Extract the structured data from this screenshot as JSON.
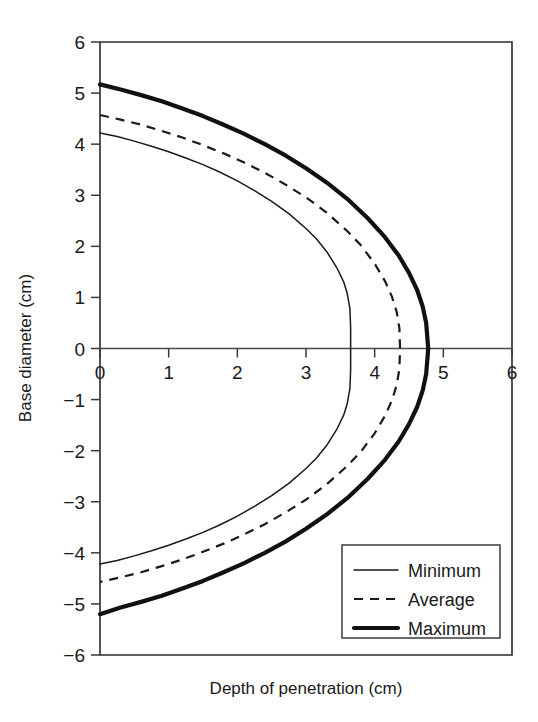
{
  "chart_data": {
    "type": "line",
    "title": "",
    "xlabel": "Depth of penetration (cm)",
    "ylabel": "Base diameter (cm)",
    "xlim": [
      0,
      6
    ],
    "ylim": [
      -6,
      6
    ],
    "xticks": [
      "0",
      "1",
      "2",
      "3",
      "4",
      "5",
      "6"
    ],
    "yticks": [
      "6",
      "5",
      "4",
      "3",
      "2",
      "1",
      "0",
      "-1",
      "-2",
      "-3",
      "-4",
      "-5",
      "-6"
    ],
    "xtick_values": [
      0,
      1,
      2,
      3,
      4,
      5,
      6
    ],
    "ytick_values": [
      6,
      5,
      4,
      3,
      2,
      1,
      0,
      -1,
      -2,
      -3,
      -4,
      -5,
      -6
    ],
    "grid": false,
    "legend_position": "lower right",
    "orientation": "x-is-depth, y-is-signed-radius (symmetric profile)",
    "series": [
      {
        "name": "Minimum",
        "style": "thin-solid",
        "color": "#1a1a1a",
        "x_at_y0": 3.65,
        "y_at_x0": 4.22,
        "points_upper": [
          [
            0.0,
            4.22
          ],
          [
            0.25,
            4.15
          ],
          [
            0.5,
            4.06
          ],
          [
            0.75,
            3.96
          ],
          [
            1.0,
            3.85
          ],
          [
            1.25,
            3.73
          ],
          [
            1.5,
            3.6
          ],
          [
            1.75,
            3.45
          ],
          [
            2.0,
            3.28
          ],
          [
            2.25,
            3.09
          ],
          [
            2.5,
            2.88
          ],
          [
            2.75,
            2.64
          ],
          [
            3.0,
            2.35
          ],
          [
            3.15,
            2.15
          ],
          [
            3.3,
            1.9
          ],
          [
            3.45,
            1.58
          ],
          [
            3.55,
            1.3
          ],
          [
            3.6,
            1.08
          ],
          [
            3.64,
            0.78
          ],
          [
            3.65,
            0.4
          ],
          [
            3.65,
            0.0
          ]
        ],
        "points_lower": [
          [
            3.65,
            0.0
          ],
          [
            3.65,
            -0.4
          ],
          [
            3.64,
            -0.78
          ],
          [
            3.6,
            -1.08
          ],
          [
            3.55,
            -1.3
          ],
          [
            3.45,
            -1.58
          ],
          [
            3.3,
            -1.9
          ],
          [
            3.15,
            -2.15
          ],
          [
            3.0,
            -2.35
          ],
          [
            2.75,
            -2.64
          ],
          [
            2.5,
            -2.88
          ],
          [
            2.25,
            -3.09
          ],
          [
            2.0,
            -3.28
          ],
          [
            1.75,
            -3.45
          ],
          [
            1.5,
            -3.6
          ],
          [
            1.25,
            -3.73
          ],
          [
            1.0,
            -3.85
          ],
          [
            0.75,
            -3.96
          ],
          [
            0.5,
            -4.06
          ],
          [
            0.25,
            -4.15
          ],
          [
            0.0,
            -4.22
          ]
        ]
      },
      {
        "name": "Average",
        "style": "dashed",
        "color": "#1a1a1a",
        "x_at_y0": 4.37,
        "y_at_x0": 4.57,
        "points_upper": [
          [
            0.0,
            4.57
          ],
          [
            0.3,
            4.48
          ],
          [
            0.6,
            4.38
          ],
          [
            0.9,
            4.26
          ],
          [
            1.2,
            4.13
          ],
          [
            1.5,
            3.98
          ],
          [
            1.8,
            3.82
          ],
          [
            2.1,
            3.64
          ],
          [
            2.4,
            3.44
          ],
          [
            2.7,
            3.21
          ],
          [
            3.0,
            2.96
          ],
          [
            3.3,
            2.66
          ],
          [
            3.6,
            2.3
          ],
          [
            3.8,
            2.02
          ],
          [
            4.0,
            1.66
          ],
          [
            4.15,
            1.32
          ],
          [
            4.25,
            1.02
          ],
          [
            4.32,
            0.72
          ],
          [
            4.36,
            0.4
          ],
          [
            4.37,
            0.0
          ]
        ],
        "points_lower": [
          [
            4.37,
            0.0
          ],
          [
            4.36,
            -0.4
          ],
          [
            4.32,
            -0.72
          ],
          [
            4.25,
            -1.02
          ],
          [
            4.15,
            -1.32
          ],
          [
            4.0,
            -1.66
          ],
          [
            3.8,
            -2.02
          ],
          [
            3.6,
            -2.3
          ],
          [
            3.3,
            -2.66
          ],
          [
            3.0,
            -2.96
          ],
          [
            2.7,
            -3.21
          ],
          [
            2.4,
            -3.44
          ],
          [
            2.1,
            -3.64
          ],
          [
            1.8,
            -3.82
          ],
          [
            1.5,
            -3.98
          ],
          [
            1.2,
            -4.13
          ],
          [
            0.9,
            -4.26
          ],
          [
            0.6,
            -4.38
          ],
          [
            0.3,
            -4.48
          ],
          [
            0.0,
            -4.57
          ]
        ]
      },
      {
        "name": "Maximum",
        "style": "thick-solid",
        "color": "#111111",
        "x_at_y0": 4.78,
        "y_at_x0": 5.17,
        "points_upper": [
          [
            0.0,
            5.17
          ],
          [
            0.3,
            5.07
          ],
          [
            0.6,
            4.96
          ],
          [
            0.9,
            4.84
          ],
          [
            1.2,
            4.7
          ],
          [
            1.5,
            4.55
          ],
          [
            1.8,
            4.38
          ],
          [
            2.1,
            4.2
          ],
          [
            2.4,
            4.0
          ],
          [
            2.7,
            3.78
          ],
          [
            3.0,
            3.53
          ],
          [
            3.3,
            3.25
          ],
          [
            3.6,
            2.93
          ],
          [
            3.9,
            2.55
          ],
          [
            4.15,
            2.18
          ],
          [
            4.35,
            1.82
          ],
          [
            4.5,
            1.48
          ],
          [
            4.62,
            1.14
          ],
          [
            4.7,
            0.82
          ],
          [
            4.75,
            0.5
          ],
          [
            4.78,
            0.0
          ]
        ],
        "points_lower": [
          [
            4.78,
            0.0
          ],
          [
            4.75,
            -0.5
          ],
          [
            4.7,
            -0.82
          ],
          [
            4.62,
            -1.14
          ],
          [
            4.5,
            -1.48
          ],
          [
            4.35,
            -1.82
          ],
          [
            4.15,
            -2.18
          ],
          [
            3.9,
            -2.55
          ],
          [
            3.6,
            -2.93
          ],
          [
            3.3,
            -3.25
          ],
          [
            3.0,
            -3.53
          ],
          [
            2.7,
            -3.78
          ],
          [
            2.4,
            -4.0
          ],
          [
            2.1,
            -4.2
          ],
          [
            1.8,
            -4.38
          ],
          [
            1.5,
            -4.55
          ],
          [
            1.2,
            -4.7
          ],
          [
            0.9,
            -4.84
          ],
          [
            0.6,
            -4.96
          ],
          [
            0.3,
            -5.07
          ],
          [
            0.0,
            -5.2
          ]
        ]
      }
    ],
    "legend": [
      {
        "label": "Minimum",
        "style": "thin-solid"
      },
      {
        "label": "Average",
        "style": "dashed"
      },
      {
        "label": "Maximum",
        "style": "thick-solid"
      }
    ]
  }
}
